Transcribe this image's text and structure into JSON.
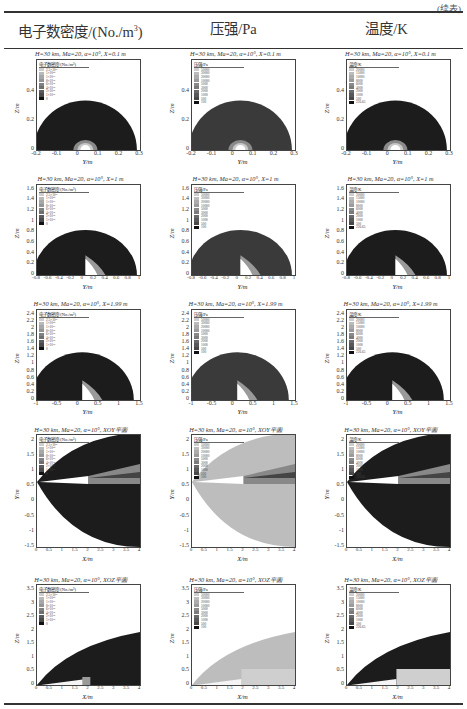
{
  "page": {
    "continuation_mark": "(续表)",
    "columns": [
      {
        "label_main": "电子数密度/(No./m",
        "label_sup": "3",
        "label_tail": ")"
      },
      {
        "label_main": "压强/Pa",
        "label_sup": "",
        "label_tail": ""
      },
      {
        "label_main": "温度/K",
        "label_sup": "",
        "label_tail": ""
      }
    ]
  },
  "rows": [
    {
      "slice": "X=0.1 m",
      "title": "H=30 km, Ma=20, α=10°, X=0.1 m",
      "xlabel": "Y/m",
      "ylabel": "Z/m",
      "xticks": [
        "-0.2",
        "-0.1",
        "0",
        "0.1",
        "0.2",
        "0.3"
      ],
      "yticks": [
        "0",
        "0.2",
        "0.4"
      ]
    },
    {
      "slice": "X=1 m",
      "title": "H=30 km, Ma=20, α=10°, X=1 m",
      "xlabel": "Y/m",
      "ylabel": "Z/m",
      "xticks": [
        "-0.8",
        "-0.6",
        "-0.4",
        "-0.2",
        "0",
        "0.2",
        "0.4",
        "0.6",
        "0.8",
        "1"
      ],
      "yticks": [
        "0",
        "0.2",
        "0.4",
        "0.6",
        "0.8",
        "1",
        "1.2",
        "1.4",
        "1.6"
      ]
    },
    {
      "slice": "X=1.99 m",
      "title": "H=30 km, Ma=20, α=10°, X=1.99 m",
      "xlabel": "Y/m",
      "ylabel": "Z/m",
      "xticks": [
        "-1",
        "-0.5",
        "0",
        "0.5",
        "1",
        "1.5"
      ],
      "yticks": [
        "0",
        "0.2",
        "0.4",
        "0.6",
        "0.8",
        "1",
        "1.2",
        "1.4",
        "1.6",
        "1.8",
        "2",
        "2.2",
        "2.4"
      ]
    },
    {
      "slice": "XOY平面",
      "title": "H=30 km, Ma=20, α=10°, XOY平面",
      "xlabel": "X/m",
      "ylabel": "Y/m",
      "xticks": [
        "0",
        "0.5",
        "1",
        "1.5",
        "2",
        "2.5",
        "3",
        "3.5",
        "4"
      ],
      "yticks": [
        "-1.5",
        "-1",
        "-0.5",
        "0",
        "0.5",
        "1",
        "1.5",
        "2"
      ]
    },
    {
      "slice": "XOZ平面",
      "title": "H=30 km, Ma=20, α=10°, XOZ平面",
      "xlabel": "X/m",
      "ylabel": "Z/m",
      "xticks": [
        "0",
        "0.5",
        "1",
        "1.5",
        "2",
        "2.5",
        "3",
        "3.5",
        "4"
      ],
      "yticks": [
        "0",
        "0.5",
        "1",
        "1.5",
        "2",
        "2.5",
        "3",
        "3.5"
      ]
    }
  ],
  "legends": {
    "electron_density": {
      "title": "电子数密度/(No./m³)",
      "levels": [
        "2.5×10²¹",
        "1×10²⁰",
        "1×10¹⁹",
        "8×10¹⁸",
        "6×10¹⁸",
        "4×10¹⁸",
        "2×10¹⁸",
        "1×10¹⁸",
        "0"
      ]
    },
    "pressure": {
      "title": "压强/Pa",
      "levels": [
        "50000",
        "30000",
        "20000",
        "10000",
        "5000",
        "3000",
        "2000",
        "1000",
        "500",
        "100"
      ]
    },
    "temperature": {
      "title": "温度/K",
      "levels": [
        "20000",
        "15000",
        "10000",
        "8000",
        "6000",
        "4000",
        "2000",
        "1000",
        "500",
        "226.65"
      ]
    }
  },
  "colors": {
    "dark_field": "#1c1c1c",
    "pressure_field": "#3a3a3a",
    "pressure_light_field": "#bdbdbd",
    "body": "#ffffff",
    "rule": "#333333"
  }
}
